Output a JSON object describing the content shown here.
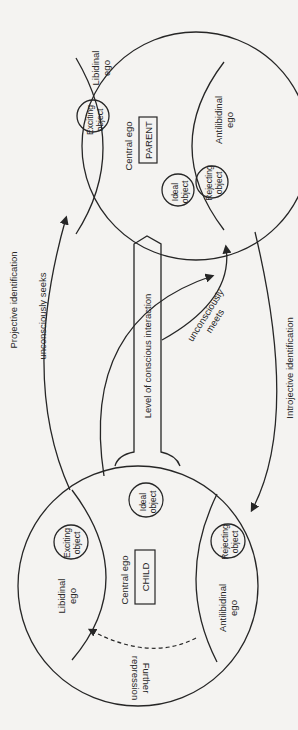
{
  "diagram": {
    "type": "psychoanalytic object-relations diagram (rotated 90°)",
    "parent": {
      "label": "PARENT",
      "central_ego": "Central ego",
      "libidinal_ego": [
        "Libidinal",
        "ego"
      ],
      "antilibidinal_ego": [
        "Antilibidinal",
        "ego"
      ],
      "exciting_object": [
        "Exciting",
        "object"
      ],
      "rejecting_object": [
        "Rejecting",
        "object"
      ],
      "ideal_object": [
        "Ideal",
        "object"
      ]
    },
    "child": {
      "label": "CHILD",
      "central_ego": "Central ego",
      "libidinal_ego": [
        "Libidinal",
        "ego"
      ],
      "antilibidinal_ego": [
        "Antilibidinal",
        "ego"
      ],
      "exciting_object": [
        "Exciting",
        "object"
      ],
      "rejecting_object": [
        "Rejecting",
        "object"
      ],
      "ideal_object": [
        "Ideal",
        "object"
      ],
      "further_repression": [
        "Further",
        "repression"
      ]
    },
    "connector_label": "Level of conscious interaction",
    "arrows": {
      "projective": "Projective identification",
      "seeks": "unconsciously seeks",
      "meets": [
        "unconsciously",
        "meets"
      ],
      "introjective": "Introjective identification"
    },
    "colors": {
      "ink": "#262626",
      "paper": "#f4f3f1"
    }
  }
}
